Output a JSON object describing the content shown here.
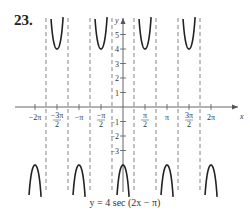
{
  "problem_number": "23.",
  "caption": "y = 4 sec (2x − π)",
  "chart_data": {
    "type": "line",
    "title": "y = 4 sec (2x − π)",
    "xlabel": "x",
    "ylabel": "y",
    "x_ticks": [
      "−2π",
      "−3π/2",
      "−π",
      "−π/2",
      "π/2",
      "π",
      "3π/2",
      "2π"
    ],
    "x_tick_values": [
      -6.2832,
      -4.7124,
      -3.1416,
      -1.5708,
      1.5708,
      3.1416,
      4.7124,
      6.2832
    ],
    "y_ticks": [
      "−3",
      "−2",
      "−1",
      "1",
      "2",
      "3",
      "4",
      "5"
    ],
    "y_tick_values": [
      -3,
      -2,
      -1,
      1,
      2,
      3,
      4,
      5
    ],
    "xlim": [
      -7.1,
      7.9
    ],
    "ylim": [
      -6.2,
      6.6
    ],
    "grid": false,
    "asymptotes_x": [
      "−7π/4",
      "−5π/4",
      "−3π/4",
      "−π/4",
      "π/4",
      "3π/4",
      "5π/4",
      "7π/4"
    ],
    "asymptote_values": [
      -5.4978,
      -3.927,
      -2.3562,
      -0.7854,
      0.7854,
      2.3562,
      3.927,
      5.4978
    ],
    "series": [
      {
        "name": "upper branches (local min y=4)",
        "centers": [
          "−3π/2",
          "−π/2",
          "π/2",
          "3π/2"
        ],
        "center_values": [
          -4.7124,
          -1.5708,
          1.5708,
          4.7124
        ],
        "vertex_y": 4
      },
      {
        "name": "lower branches (local max y=−4)",
        "centers": [
          "−2π",
          "−π",
          "0",
          "π",
          "2π"
        ],
        "center_values": [
          -6.2832,
          -3.1416,
          0,
          3.1416,
          6.2832
        ],
        "vertex_y": -4
      }
    ]
  },
  "colors": {
    "curve": "#222222",
    "axis": "#555555",
    "asymptote": "#666666"
  }
}
